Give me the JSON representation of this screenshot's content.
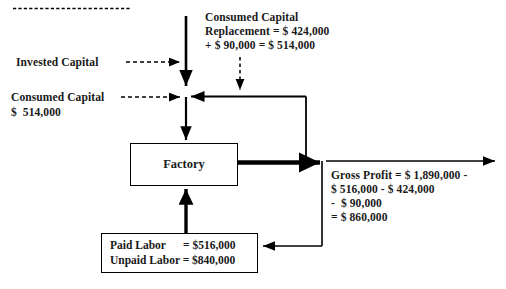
{
  "diagram": {
    "title_rule": "dashed-top-rule",
    "nodes": {
      "factory": {
        "label": "Factory"
      },
      "labor": {
        "line1": "Paid Labor      = $516,000",
        "line2": "Unpaid Labor = $840,000"
      }
    },
    "labels": {
      "invested_capital": "Invested Capital",
      "consumed_capital_line1": "Consumed Capital",
      "consumed_capital_line2": "$  514,000",
      "replacement_line1": "Consumed Capital",
      "replacement_line2": "Replacement = $ 424,000",
      "replacement_line3": "+ $ 90,000 = $ 514,000",
      "gross_profit_line1": "Gross Profit = $ 1,890,000 -",
      "gross_profit_line2": "$ 516,000 - $ 424,000",
      "gross_profit_line3": "-  $ 90,000",
      "gross_profit_line4": "= $ 860,000"
    },
    "colors": {
      "stroke": "#000000",
      "text": "#1a1a1a",
      "background": "#ffffff"
    }
  }
}
